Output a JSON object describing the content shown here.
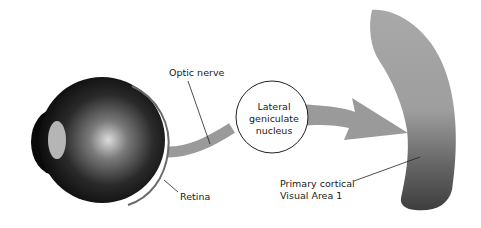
{
  "diagram": {
    "labels": {
      "optic_nerve": "Optic nerve",
      "retina": "Retina",
      "lgn_line1": "Lateral",
      "lgn_line2": "geniculate",
      "lgn_line3": "nucleus",
      "v1_line1": "Primary cortical",
      "v1_line2": "Visual Area 1"
    },
    "colors": {
      "pathway": "#9a9a9a",
      "eye_dark": "#0a0a0a",
      "eye_highlight": "#d8d8d8",
      "cortex_light": "#aaaaaa",
      "cortex_dark": "#4a4a4a",
      "outline": "#222222"
    }
  }
}
